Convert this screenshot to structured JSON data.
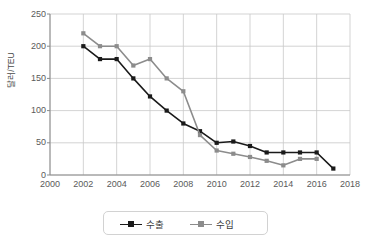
{
  "chart_data": {
    "type": "line",
    "title": "",
    "subtitle": "",
    "xlabel": "",
    "ylabel": "달러/TEU",
    "x": [
      2002,
      2003,
      2004,
      2005,
      2006,
      2007,
      2008,
      2009,
      2010,
      2011,
      2012,
      2013,
      2014,
      2015,
      2016,
      2017
    ],
    "xlim": [
      2000,
      2018
    ],
    "ylim": [
      0,
      250
    ],
    "xticks": [
      "2000",
      "2002",
      "2004",
      "2006",
      "2008",
      "2010",
      "2012",
      "2014",
      "2016",
      "2018"
    ],
    "xtick_values": [
      2000,
      2002,
      2004,
      2006,
      2008,
      2010,
      2012,
      2014,
      2016,
      2018
    ],
    "yticks": [
      "0",
      "50",
      "100",
      "150",
      "200",
      "250"
    ],
    "ytick_values": [
      0,
      50,
      100,
      150,
      200,
      250
    ],
    "grid": true,
    "legend_position": "bottom",
    "series": [
      {
        "name": "수출",
        "color": "#1a1a1a",
        "marker": "square",
        "x": [
          2002,
          2003,
          2004,
          2005,
          2006,
          2007,
          2008,
          2009,
          2010,
          2011,
          2012,
          2013,
          2014,
          2015,
          2016,
          2017
        ],
        "values": [
          200,
          180,
          180,
          150,
          122,
          100,
          80,
          68,
          50,
          52,
          45,
          35,
          35,
          35,
          35,
          10
        ]
      },
      {
        "name": "수입",
        "color": "#8c8c8c",
        "marker": "square",
        "x": [
          2002,
          2003,
          2004,
          2005,
          2006,
          2007,
          2008,
          2009,
          2010,
          2011,
          2012,
          2013,
          2014,
          2015,
          2016
        ],
        "values": [
          220,
          200,
          200,
          170,
          180,
          150,
          130,
          62,
          38,
          33,
          28,
          22,
          15,
          25,
          25
        ]
      }
    ]
  },
  "legend": {
    "items": [
      {
        "label": "수출",
        "color": "#1a1a1a"
      },
      {
        "label": "수입",
        "color": "#8c8c8c"
      }
    ]
  },
  "colors": {
    "export_line": "#1a1a1a",
    "import_line": "#8c8c8c",
    "grid": "#c8c8c8",
    "axis": "#8a8a8a",
    "tick_text": "#5a5a5a",
    "plot_background": "#ffffff"
  }
}
